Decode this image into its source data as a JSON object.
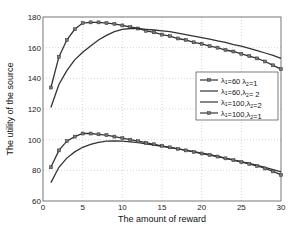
{
  "chart_data": {
    "type": "line",
    "title": "",
    "xlabel": "The amount of reward",
    "ylabel": "The utility of the source",
    "xlim": [
      0,
      30
    ],
    "ylim": [
      60,
      180
    ],
    "xticks": [
      0,
      5,
      10,
      15,
      20,
      25,
      30
    ],
    "yticks": [
      60,
      80,
      100,
      120,
      140,
      160,
      180
    ],
    "grid": true,
    "legend_position": "right-center",
    "x": [
      1,
      2,
      3,
      4,
      5,
      6,
      7,
      8,
      9,
      10,
      11,
      12,
      13,
      14,
      15,
      16,
      17,
      18,
      19,
      20,
      21,
      22,
      23,
      24,
      25,
      26,
      27,
      28,
      29,
      30
    ],
    "series": [
      {
        "name": "λ1=60 λ2=1",
        "legend_main": "λ",
        "sub1": "1",
        "mid": "=60 λ",
        "sub2": "2",
        "tail": "=1",
        "marker": true,
        "values": [
          134,
          154,
          165,
          172,
          176,
          176.5,
          176.5,
          176,
          175.5,
          174.5,
          173.5,
          172.5,
          171,
          170,
          168.5,
          167.5,
          166,
          165,
          163.5,
          162.5,
          161,
          160,
          158.5,
          157.5,
          156,
          154.5,
          153,
          151,
          148.5,
          146
        ]
      },
      {
        "name": "λ1=60,λ2=2",
        "legend_main": "λ",
        "sub1": "1",
        "mid": "=60,λ",
        "sub2": "2",
        "tail": "= 2",
        "marker": false,
        "values": [
          121,
          136,
          145,
          152,
          157,
          161,
          165,
          168,
          170.5,
          172,
          172.5,
          172.5,
          172,
          171.5,
          171,
          170.5,
          169.5,
          168.5,
          167.5,
          166.5,
          165.5,
          164.5,
          163.5,
          162,
          161,
          159.5,
          158,
          156.5,
          155,
          153
        ]
      },
      {
        "name": "λ1=100,λ2=2",
        "legend_main": "λ",
        "sub1": "1",
        "mid": "=100,λ",
        "sub2": "2",
        "tail": "=2",
        "marker": false,
        "values": [
          72,
          82,
          88,
          92,
          95,
          97,
          98.3,
          99,
          99.2,
          99,
          98.6,
          98,
          97.3,
          96.5,
          95.7,
          94.9,
          94,
          93.1,
          92.2,
          91.2,
          90.2,
          89.1,
          88,
          86.9,
          85.7,
          84.5,
          83.2,
          81.9,
          80.5,
          79
        ]
      },
      {
        "name": "λ1=100,λ2=1",
        "legend_main": "λ",
        "sub1": "1",
        "mid": "=100,λ",
        "sub2": "2",
        "tail": "=1",
        "marker": true,
        "values": [
          82,
          93,
          99,
          102,
          104,
          104,
          103.5,
          103,
          102,
          101,
          100,
          99,
          98,
          97,
          96,
          95,
          94,
          93,
          92,
          91,
          90,
          89,
          87.8,
          86.6,
          85.4,
          84.2,
          82.8,
          81.2,
          79.3,
          77
        ]
      }
    ]
  }
}
